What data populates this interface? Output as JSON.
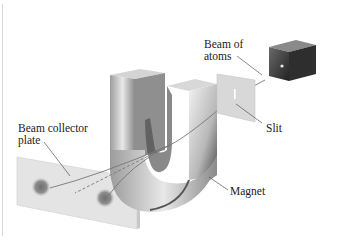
{
  "diagram": {
    "labels": {
      "beam_of_atoms_line1": "Beam of",
      "beam_of_atoms_line2": "atoms",
      "slit": "Slit",
      "magnet": "Magnet",
      "collector_line1": "Beam collector",
      "collector_line2": "plate"
    },
    "components": [
      "oven",
      "slit-plate",
      "magnet",
      "beam-collector-plate"
    ],
    "colors": {
      "oven": "#3a3a3a",
      "magnet_light": "#e6e6e6",
      "magnet_dark": "#5a5a5a",
      "plate": "#dcdcdc",
      "spot": "#7a7a7a",
      "beam": "#777777",
      "leader": "#555555"
    }
  }
}
